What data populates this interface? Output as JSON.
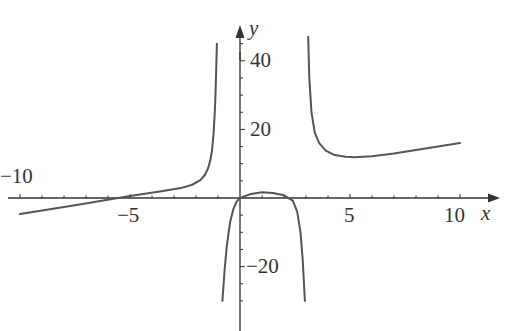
{
  "chart_data": {
    "type": "line",
    "title": "",
    "xlabel": "x",
    "ylabel": "y",
    "xlim": [
      -10.9,
      11.5
    ],
    "ylim": [
      -30,
      48
    ],
    "grid": false,
    "legend": null,
    "x_ticks": [
      -10,
      -5,
      5,
      10
    ],
    "x_tick_labels": [
      "−10",
      "−5",
      "5",
      "10"
    ],
    "y_ticks": [
      -20,
      20,
      40
    ],
    "y_tick_labels": [
      "−20",
      "20",
      "40"
    ],
    "vertical_asymptotes": [
      -1,
      3.1
    ],
    "series": [
      {
        "name": "left branch",
        "x": [
          -10,
          -7.5,
          -5,
          -3.5,
          -2.7,
          -2.2,
          -1.8,
          -1.6,
          -1.45,
          -1.35,
          -1.27,
          -1.2,
          -1.14,
          -1.1,
          -1.05
        ],
        "y": [
          -4.7,
          -2.1,
          0.6,
          2.0,
          2.9,
          3.8,
          5.2,
          6.7,
          8.7,
          11.0,
          14.0,
          19.0,
          25.6,
          33.0,
          45.0
        ]
      },
      {
        "name": "middle branch",
        "x": [
          -0.8,
          -0.7,
          -0.6,
          -0.45,
          -0.3,
          -0.15,
          0,
          0.5,
          1.0,
          1.5,
          2.0,
          2.4,
          2.6,
          2.75,
          2.85,
          2.95
        ],
        "y": [
          -30,
          -21,
          -14,
          -7,
          -3.2,
          -1.0,
          0,
          1.2,
          1.7,
          1.5,
          0.8,
          -0.8,
          -4,
          -10,
          -18,
          -30
        ]
      },
      {
        "name": "right branch",
        "x": [
          3.1,
          3.15,
          3.25,
          3.4,
          3.6,
          3.9,
          4.3,
          4.8,
          5.2,
          6,
          7,
          8,
          9,
          10
        ],
        "y": [
          47,
          35,
          25,
          19,
          16,
          13.8,
          12.5,
          12,
          11.9,
          12.2,
          13.0,
          14.0,
          15.0,
          16.0
        ]
      }
    ]
  },
  "axes": {
    "x_label": "x",
    "y_label": "y"
  }
}
